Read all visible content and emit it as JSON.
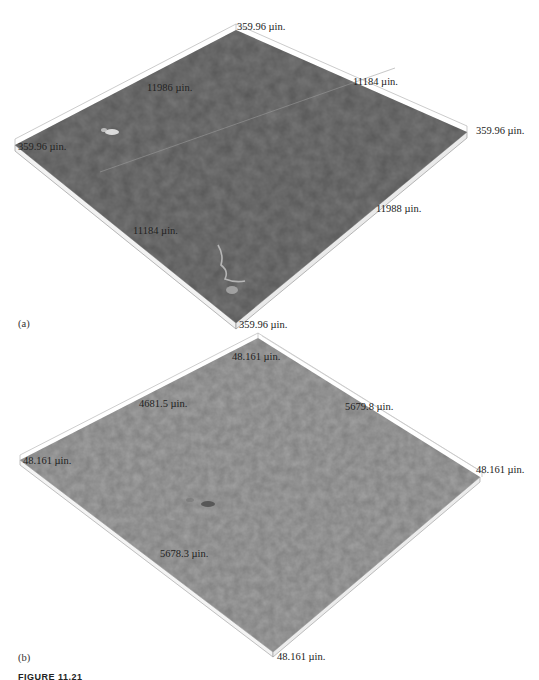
{
  "figure": {
    "caption_partial": "FIGURE 11.21",
    "panels": [
      {
        "id": "a",
        "panel_label": "(a)",
        "surface_color": "#787878",
        "labels": {
          "top_height": "359.96 µin.",
          "left_height": "359.96 µin.",
          "right_height": "359.96 µin.",
          "bottom_height": "359.96 µin.",
          "back_left_length": "11986 µin.",
          "back_right_length": "11184 µin.",
          "front_left_length": "11184 µin.",
          "front_right_length": "11988 µin."
        }
      },
      {
        "id": "b",
        "panel_label": "(b)",
        "surface_color": "#a2a2a2",
        "labels": {
          "top_height": "48.161 µin.",
          "left_height": "48.161 µin.",
          "right_height": "48.161 µin.",
          "bottom_height": "48.161 µin.",
          "back_left_length": "4681.5 µin.",
          "back_right_length": "5679.8 µin.",
          "front_left_length": "5678.3 µin."
        }
      }
    ]
  }
}
